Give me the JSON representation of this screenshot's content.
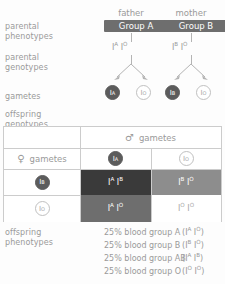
{
  "labels": {
    "parental_phenotypes": "parental\nphenotypes",
    "parental_genotypes": "parental\ngenotypes",
    "gametes": "gametes",
    "offspring_genotypes": "offspring\ngenotypes",
    "offspring_phenotypes": "offspring\nphenotypes"
  },
  "colors": {
    "badge_bg": "#6e6e6e",
    "text": "#9a9a9a",
    "gamete_filled": "#5c5c5c",
    "cell_AB": "#3a3a3a",
    "cell_BO": "#8d8d8d",
    "cell_AO": "#6e6e6e",
    "cell_OO": "#ffffff",
    "border": "#cccccc"
  },
  "parents": {
    "father": {
      "title": "father",
      "phenotype": "Group A",
      "allele1": "I",
      "allele1_sup": "A",
      "allele2": "I",
      "allele2_sup": "O",
      "gamete1": {
        "allele": "I",
        "sup": "A",
        "style": "filled"
      },
      "gamete2": {
        "allele": "I",
        "sup": "O",
        "style": "hollow"
      }
    },
    "mother": {
      "title": "mother",
      "phenotype": "Group B",
      "allele1": "I",
      "allele1_sup": "B",
      "allele2": "I",
      "allele2_sup": "O",
      "gamete1": {
        "allele": "I",
        "sup": "B",
        "style": "filled"
      },
      "gamete2": {
        "allele": "I",
        "sup": "O",
        "style": "hollow"
      }
    }
  },
  "punnett": {
    "male_header": "gametes",
    "male_symbol": "♂",
    "female_header": "gametes",
    "female_symbol": "♀",
    "col_gametes": [
      {
        "allele": "I",
        "sup": "A",
        "style": "filled"
      },
      {
        "allele": "I",
        "sup": "O",
        "style": "hollow"
      }
    ],
    "row_gametes": [
      {
        "allele": "I",
        "sup": "B",
        "style": "filled"
      },
      {
        "allele": "I",
        "sup": "O",
        "style": "hollow"
      }
    ],
    "cells": [
      {
        "a1": "I",
        "s1": "A",
        "a2": "I",
        "s2": "B",
        "bg": "#3a3a3a",
        "fg": "#ffffff"
      },
      {
        "a1": "I",
        "s1": "B",
        "a2": "I",
        "s2": "O",
        "bg": "#8d8d8d",
        "fg": "#ffffff"
      },
      {
        "a1": "I",
        "s1": "A",
        "a2": "I",
        "s2": "O",
        "bg": "#6e6e6e",
        "fg": "#ffffff"
      },
      {
        "a1": "I",
        "s1": "O",
        "a2": "I",
        "s2": "O",
        "bg": "#ffffff",
        "fg": "#a8a8a8"
      }
    ]
  },
  "offspring_phenotypes": [
    {
      "text": "25% blood group A",
      "a1": "I",
      "s1": "A",
      "a2": "I",
      "s2": "O"
    },
    {
      "text": "25% blood group B",
      "a1": "I",
      "s1": "B",
      "a2": "I",
      "s2": "O"
    },
    {
      "text": "25% blood group AB",
      "a1": "I",
      "s1": "A",
      "a2": "I",
      "s2": "B"
    },
    {
      "text": "25% blood group O",
      "a1": "I",
      "s1": "O",
      "a2": "I",
      "s2": "O"
    }
  ]
}
